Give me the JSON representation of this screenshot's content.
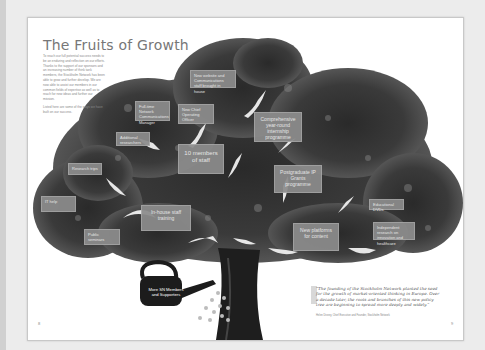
{
  "document": {
    "title": "The Fruits of Growth",
    "intro_paragraphs": [
      "To reach our full potential success needs to be an enduring and reflection on our efforts. Thanks to the support of our sponsors and an increasing number of think tank members, the Stockholm Network has been able to grow and further develop. We are now able to assist our members in our common fields of expertise as well as to reach for new ideas and further our mission.",
      "Listed here are some of the ways we have built on our success."
    ],
    "page_numbers": {
      "left": "8",
      "right": "9"
    }
  },
  "tree": {
    "root_label": "More SN Members and Supporters",
    "boxes": [
      {
        "id": "new-website",
        "label": "New website and Communications staff brought in house"
      },
      {
        "id": "full-time-network-communications",
        "label": "Full-time Network Communications Manager"
      },
      {
        "id": "new-chief-operating-officer",
        "label": "New Chief Operating Officer"
      },
      {
        "id": "comprehensive-internship",
        "label": "Comprehensive year-round internship programme"
      },
      {
        "id": "additional-interns",
        "label": "Additional researchers"
      },
      {
        "id": "ten-members-of-staff",
        "label": "10 members of staff"
      },
      {
        "id": "research-trips",
        "label": "Research trips"
      },
      {
        "id": "postgraduate-ip-grants",
        "label": "Postgraduate IP Grants programme"
      },
      {
        "id": "x-city",
        "label": "IT help"
      },
      {
        "id": "in-house-staff-training",
        "label": "In-house staff training"
      },
      {
        "id": "educational-dvds",
        "label": "Educational DVDs"
      },
      {
        "id": "public-seminars",
        "label": "Public seminars"
      },
      {
        "id": "new-platforms-for-content",
        "label": "New platforms for content"
      },
      {
        "id": "independent-research",
        "label": "Independent research on innovation and healthcare"
      }
    ]
  },
  "quote": {
    "text": "“The founding of the Stockholm Network planted the seed for the growth of market-oriented thinking in Europe. Over a decade later, the roots and branches of this new policy tree are beginning to spread more deeply and widely.”",
    "attribution": "Helen Disney, Chief Executive and Founder, Stockholm Network"
  },
  "colors": {
    "box_fill": "#8c8c8c",
    "box_text": "#f2f2f2",
    "title_text": "#777777",
    "page_bg": "#ffffff",
    "canvas_bg": "#ececec"
  }
}
